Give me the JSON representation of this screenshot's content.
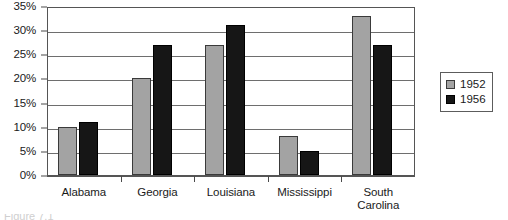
{
  "chart_data": {
    "type": "bar",
    "title": "",
    "subtitle": "",
    "xlabel": "",
    "ylabel": "",
    "categories": [
      "Alabama",
      "Georgia",
      "Louisiana",
      "Mississippi",
      "South\nCarolina"
    ],
    "series": [
      {
        "name": "1952",
        "color": "#a3a3a3",
        "values": [
          10,
          20,
          27,
          8,
          33
        ]
      },
      {
        "name": "1956",
        "color": "#161616",
        "values": [
          11,
          27,
          31,
          5,
          27
        ]
      }
    ],
    "ylim": [
      0,
      35
    ],
    "ytick_values": [
      0,
      5,
      10,
      15,
      20,
      25,
      30,
      35
    ],
    "ytick_labels": [
      "0%",
      "5%",
      "10%",
      "15%",
      "20%",
      "25%",
      "30%",
      "35%"
    ],
    "grid": true,
    "legend_position": "right"
  },
  "legend": {
    "entries": [
      {
        "label": "1952",
        "swatch": "gray-square-swatch"
      },
      {
        "label": "1956",
        "swatch": "black-square-swatch"
      }
    ]
  },
  "caption": {
    "text": "Figure 7.1"
  }
}
